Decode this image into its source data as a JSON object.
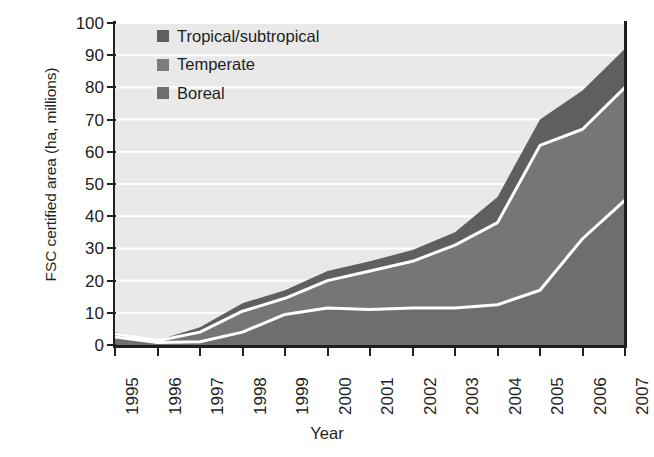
{
  "chart_data": {
    "type": "area",
    "stacked": true,
    "title": "",
    "xlabel": "Year",
    "ylabel": "FSC certified area (ha, millions)",
    "x": [
      1995,
      1996,
      1997,
      1998,
      1999,
      2000,
      2001,
      2002,
      2003,
      2004,
      2005,
      2006,
      2007
    ],
    "categories": [
      "1995",
      "1996",
      "1997",
      "1998",
      "1999",
      "2000",
      "2001",
      "2002",
      "2003",
      "2004",
      "2005",
      "2006",
      "2007"
    ],
    "xlim": [
      1995,
      2007
    ],
    "ylim": [
      0,
      100
    ],
    "yticks": [
      0,
      10,
      20,
      30,
      40,
      50,
      60,
      70,
      80,
      90,
      100
    ],
    "ytick_labels": [
      "0",
      "10",
      "20",
      "30",
      "40",
      "50",
      "60",
      "70",
      "80",
      "90",
      "100"
    ],
    "grid": "horizontal-white",
    "legend_position": "top-left-inside",
    "series": [
      {
        "name": "Boreal",
        "color": "#6e6e6e",
        "values": [
          2.5,
          0.8,
          1.0,
          4.0,
          9.5,
          11.5,
          11.0,
          11.5,
          11.5,
          12.5,
          17.0,
          33.0,
          45.0
        ]
      },
      {
        "name": "Temperate",
        "color": "#767676",
        "values": [
          1.0,
          0.5,
          3.0,
          6.5,
          5.0,
          8.5,
          12.0,
          14.5,
          19.5,
          25.5,
          45.0,
          34.0,
          35.0
        ]
      },
      {
        "name": "Tropical/subtropical",
        "color": "#5f5f5f",
        "values": [
          0.5,
          0.2,
          1.5,
          2.5,
          2.5,
          3.0,
          3.0,
          3.5,
          4.0,
          8.0,
          8.0,
          12.0,
          12.0
        ]
      }
    ],
    "cumulative": {
      "boreal_top": [
        2.5,
        0.8,
        1.0,
        4.0,
        9.5,
        11.5,
        11.0,
        11.5,
        11.5,
        12.5,
        17.0,
        33.0,
        45.0
      ],
      "temperate_top": [
        3.5,
        1.3,
        4.0,
        10.5,
        14.5,
        20.0,
        23.0,
        26.0,
        31.0,
        38.0,
        62.0,
        67.0,
        80.0
      ],
      "total": [
        4.0,
        1.5,
        5.5,
        13.0,
        17.0,
        23.0,
        26.0,
        29.5,
        35.0,
        46.0,
        70.0,
        79.0,
        92.0
      ]
    }
  },
  "legend": {
    "items": [
      {
        "label": "Tropical/subtropical",
        "color": "#5f5f5f"
      },
      {
        "label": "Temperate",
        "color": "#7d7d7d"
      },
      {
        "label": "Boreal",
        "color": "#6e6e6e"
      }
    ]
  },
  "axes": {
    "y_title": "FSC certified area (ha, millions)",
    "x_title": "Year"
  },
  "colors": {
    "plot_background": "#e9e9e9",
    "gridline": "#ffffff",
    "axis": "#231f20",
    "boundary_line": "#ffffff",
    "text": "#231f20"
  }
}
